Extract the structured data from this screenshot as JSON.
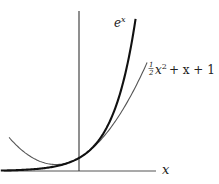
{
  "chart_data": {
    "type": "line",
    "title": "",
    "xlabel": "x",
    "ylabel": "",
    "xlim": [
      -3.4,
      4.0
    ],
    "ylim": [
      0,
      13
    ],
    "grid": false,
    "legend": "none (curves labeled directly)",
    "series": [
      {
        "name": "e^x",
        "label_base": "e",
        "label_sup": "x",
        "function": "exp(x)",
        "x_range": [
          -3.4,
          2.46
        ],
        "emphasis": "thick"
      },
      {
        "name": "(1/2)x^2 + x + 1",
        "label_frac_num": "1",
        "label_frac_den": "2",
        "label_var": "x",
        "label_sup": "2",
        "label_rest": "+ x + 1",
        "function": "0.5*x^2 + x + 1",
        "x_range": [
          -3.04,
          2.96
        ],
        "emphasis": "thin"
      }
    ],
    "sample_points": {
      "e^x": [
        [
          -3,
          0.05
        ],
        [
          -2,
          0.14
        ],
        [
          -1,
          0.37
        ],
        [
          0,
          1
        ],
        [
          1,
          2.72
        ],
        [
          2,
          7.39
        ],
        [
          2.46,
          11.7
        ]
      ],
      "(1/2)x^2 + x + 1": [
        [
          -3,
          2.5
        ],
        [
          -2,
          1
        ],
        [
          -1,
          0.5
        ],
        [
          0,
          1
        ],
        [
          1,
          2.5
        ],
        [
          2,
          5
        ],
        [
          2.96,
          8.34
        ]
      ]
    }
  }
}
